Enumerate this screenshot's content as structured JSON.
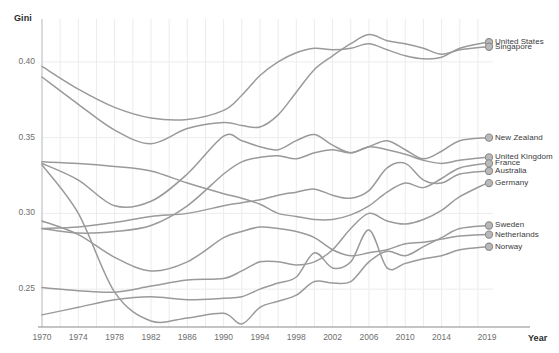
{
  "chart_data": {
    "type": "line",
    "title": "",
    "xlabel": "Year",
    "ylabel": "Gini",
    "xlim": [
      1970,
      2019
    ],
    "ylim": [
      0.225,
      0.425
    ],
    "grid": true,
    "legend_position": "right-endpoint-labels",
    "line_color": "#9a9a9a",
    "marker_color": "#a8a8a8",
    "grid_color": "#ececec",
    "axis_color": "#c9c9c9",
    "xticks": [
      1970,
      1974,
      1978,
      1982,
      1986,
      1990,
      1994,
      1998,
      2002,
      2006,
      2010,
      2014,
      2019
    ],
    "xtick_labels": [
      "1970",
      "1974",
      "1978",
      "1982",
      "1986",
      "1990",
      "1994",
      "1998",
      "2002",
      "2006",
      "2010",
      "2014",
      "2019"
    ],
    "yticks": [
      0.25,
      0.3,
      0.35,
      0.4
    ],
    "ytick_labels": [
      "0.25",
      "0.30",
      "0.35",
      "0.40"
    ],
    "series": [
      {
        "name": "United States",
        "label": "United States",
        "x": [
          1970,
          1974,
          1978,
          1982,
          1986,
          1990,
          1992,
          1994,
          1996,
          1998,
          2000,
          2002,
          2004,
          2006,
          2008,
          2010,
          2012,
          2014,
          2016,
          2019
        ],
        "values": [
          0.397,
          0.382,
          0.37,
          0.363,
          0.362,
          0.368,
          0.378,
          0.391,
          0.4,
          0.406,
          0.409,
          0.408,
          0.409,
          0.412,
          0.408,
          0.404,
          0.402,
          0.403,
          0.409,
          0.413
        ]
      },
      {
        "name": "Singapore",
        "label": "Singapore",
        "x": [
          1970,
          1974,
          1978,
          1982,
          1986,
          1990,
          1992,
          1994,
          1996,
          1998,
          2000,
          2002,
          2004,
          2006,
          2008,
          2010,
          2012,
          2014,
          2016,
          2019
        ],
        "values": [
          0.39,
          0.372,
          0.355,
          0.346,
          0.356,
          0.36,
          0.358,
          0.357,
          0.365,
          0.38,
          0.395,
          0.404,
          0.412,
          0.418,
          0.414,
          0.412,
          0.409,
          0.405,
          0.408,
          0.41
        ]
      },
      {
        "name": "New Zealand",
        "label": "New Zealand",
        "x": [
          1970,
          1974,
          1978,
          1982,
          1986,
          1990,
          1992,
          1994,
          1996,
          1998,
          2000,
          2002,
          2004,
          2006,
          2008,
          2010,
          2012,
          2014,
          2016,
          2019
        ],
        "values": [
          0.29,
          0.287,
          0.288,
          0.292,
          0.305,
          0.326,
          0.334,
          0.337,
          0.338,
          0.336,
          0.34,
          0.342,
          0.34,
          0.344,
          0.348,
          0.342,
          0.336,
          0.341,
          0.348,
          0.35
        ]
      },
      {
        "name": "United Kingdom",
        "label": "United Kingdom",
        "x": [
          1970,
          1974,
          1978,
          1982,
          1986,
          1990,
          1992,
          1994,
          1996,
          1998,
          2000,
          2002,
          2004,
          2006,
          2008,
          2010,
          2012,
          2014,
          2016,
          2019
        ],
        "values": [
          0.333,
          0.322,
          0.305,
          0.308,
          0.326,
          0.351,
          0.348,
          0.344,
          0.342,
          0.348,
          0.352,
          0.345,
          0.34,
          0.344,
          0.342,
          0.339,
          0.335,
          0.333,
          0.335,
          0.337
        ]
      },
      {
        "name": "France",
        "label": "France",
        "x": [
          1970,
          1974,
          1978,
          1982,
          1986,
          1990,
          1992,
          1994,
          1996,
          1998,
          2000,
          2002,
          2004,
          2006,
          2008,
          2010,
          2012,
          2014,
          2016,
          2019
        ],
        "values": [
          0.334,
          0.333,
          0.331,
          0.328,
          0.32,
          0.313,
          0.31,
          0.306,
          0.3,
          0.298,
          0.296,
          0.296,
          0.299,
          0.305,
          0.314,
          0.32,
          0.317,
          0.323,
          0.33,
          0.333
        ]
      },
      {
        "name": "Australia",
        "label": "Australia",
        "x": [
          1970,
          1974,
          1978,
          1982,
          1986,
          1990,
          1992,
          1994,
          1996,
          1998,
          2000,
          2002,
          2004,
          2006,
          2008,
          2010,
          2012,
          2014,
          2016,
          2019
        ],
        "values": [
          0.29,
          0.291,
          0.294,
          0.298,
          0.3,
          0.305,
          0.307,
          0.309,
          0.312,
          0.314,
          0.316,
          0.312,
          0.31,
          0.315,
          0.33,
          0.333,
          0.322,
          0.32,
          0.326,
          0.328
        ]
      },
      {
        "name": "Germany",
        "label": "Germany",
        "x": [
          1970,
          1974,
          1978,
          1982,
          1986,
          1990,
          1992,
          1994,
          1996,
          1998,
          2000,
          2002,
          2004,
          2006,
          2008,
          2010,
          2012,
          2014,
          2016,
          2019
        ],
        "values": [
          0.251,
          0.249,
          0.248,
          0.252,
          0.256,
          0.257,
          0.262,
          0.268,
          0.268,
          0.266,
          0.268,
          0.276,
          0.29,
          0.3,
          0.295,
          0.293,
          0.296,
          0.302,
          0.311,
          0.32
        ]
      },
      {
        "name": "Sweden",
        "label": "Sweden",
        "x": [
          1970,
          1974,
          1978,
          1982,
          1986,
          1990,
          1992,
          1994,
          1996,
          1998,
          2000,
          2002,
          2004,
          2006,
          2008,
          2010,
          2012,
          2014,
          2016,
          2019
        ],
        "values": [
          0.332,
          0.3,
          0.248,
          0.229,
          0.231,
          0.234,
          0.227,
          0.238,
          0.242,
          0.246,
          0.255,
          0.254,
          0.255,
          0.268,
          0.275,
          0.272,
          0.278,
          0.284,
          0.29,
          0.292
        ]
      },
      {
        "name": "Netherlands",
        "label": "Netherlands",
        "x": [
          1970,
          1974,
          1978,
          1982,
          1986,
          1990,
          1992,
          1994,
          1996,
          1998,
          2000,
          2002,
          2004,
          2006,
          2008,
          2010,
          2012,
          2014,
          2016,
          2019
        ],
        "values": [
          0.295,
          0.286,
          0.271,
          0.262,
          0.268,
          0.284,
          0.288,
          0.291,
          0.29,
          0.288,
          0.284,
          0.276,
          0.272,
          0.274,
          0.276,
          0.28,
          0.281,
          0.283,
          0.285,
          0.286
        ]
      },
      {
        "name": "Norway",
        "label": "Norway",
        "x": [
          1970,
          1974,
          1978,
          1982,
          1986,
          1990,
          1992,
          1994,
          1996,
          1998,
          2000,
          2002,
          2004,
          2006,
          2008,
          2010,
          2012,
          2014,
          2016,
          2019
        ],
        "values": [
          0.233,
          0.238,
          0.243,
          0.245,
          0.243,
          0.244,
          0.245,
          0.25,
          0.254,
          0.258,
          0.274,
          0.264,
          0.268,
          0.289,
          0.264,
          0.267,
          0.27,
          0.272,
          0.276,
          0.278
        ]
      }
    ]
  },
  "axes": {
    "y_title": "Gini",
    "x_title": "Year"
  }
}
